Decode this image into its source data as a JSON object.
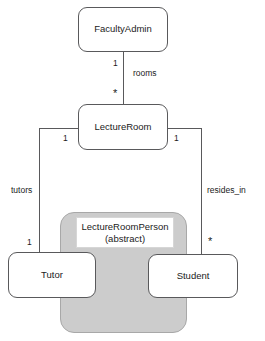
{
  "diagram": {
    "type": "uml-class-diagram",
    "background_color": "#ffffff",
    "line_color": "#59595b",
    "abstract_fill_color": "#cccccc",
    "node_fill_color": "#ffffff",
    "text_color": "#1b1b1b"
  },
  "nodes": {
    "faculty_admin": {
      "label": "FacultyAdmin"
    },
    "lecture_room": {
      "label": "LectureRoom"
    },
    "lecture_room_person": {
      "label_line1": "LectureRoomPerson",
      "label_line2": "(abstract)"
    },
    "tutor": {
      "label": "Tutor"
    },
    "student": {
      "label": "Student"
    }
  },
  "edges": {
    "rooms": {
      "name": "rooms",
      "source_multiplicity": "1",
      "target_multiplicity": "*"
    },
    "tutors": {
      "name": "tutors",
      "source_multiplicity": "1",
      "target_multiplicity": "1"
    },
    "resides_in": {
      "name": "resides_in",
      "source_multiplicity": "1",
      "target_multiplicity": "*"
    }
  }
}
